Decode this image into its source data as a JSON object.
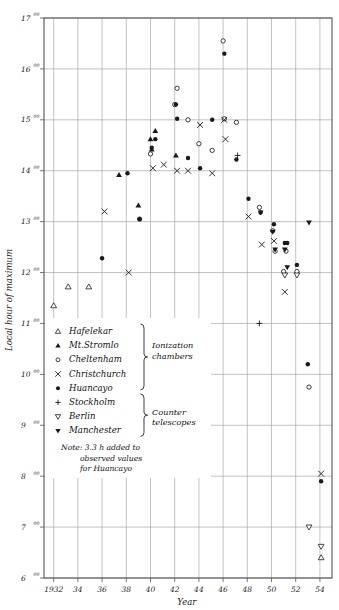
{
  "chart_data": {
    "type": "scatter",
    "title": "",
    "xlabel": "Year",
    "ylabel": "Local hour of maximum",
    "xlim": [
      1931.2,
      1955.0
    ],
    "ylim": [
      6,
      17
    ],
    "grid": true,
    "y_tick_labels": [
      "17",
      "16",
      "15",
      "14",
      "13",
      "12",
      "11",
      "10",
      "9",
      "8",
      "7",
      "6"
    ],
    "y_tick_values": [
      17,
      16,
      15,
      14,
      13,
      12,
      11,
      10,
      9,
      8,
      7,
      6
    ],
    "y_tick_superscript": "00",
    "x_tick_labels": [
      "1932",
      "34",
      "36",
      "38",
      "40",
      "42",
      "44",
      "46",
      "48",
      "50",
      "52",
      "54"
    ],
    "x_tick_values": [
      1932,
      1934,
      1936,
      1938,
      1940,
      1942,
      1944,
      1946,
      1948,
      1950,
      1952,
      1954
    ],
    "legend_position": "inside-lower-left",
    "note": [
      "Note: 3.3 h added to",
      "observed values",
      "for Huancayo"
    ],
    "groups": [
      {
        "label": "Ionization chambers",
        "members": [
          "Hafelekar",
          "Mt.Stromlo",
          "Cheltenham",
          "Christchurch",
          "Huancayo"
        ]
      },
      {
        "label": "Counter telescopes",
        "members": [
          "Stockholm",
          "Berlin",
          "Manchester"
        ]
      }
    ],
    "series": [
      {
        "name": "Hafelekar",
        "marker": "open-triangle-up",
        "points": [
          [
            1932.0,
            11.35
          ],
          [
            1933.2,
            11.72
          ],
          [
            1934.9,
            11.72
          ],
          [
            1954.1,
            6.4
          ]
        ]
      },
      {
        "name": "Mt.Stromlo",
        "marker": "filled-triangle-up",
        "points": [
          [
            1937.4,
            13.92
          ],
          [
            1939.0,
            13.32
          ],
          [
            1940.0,
            14.62
          ],
          [
            1940.1,
            14.42
          ],
          [
            1940.4,
            14.78
          ],
          [
            1942.1,
            14.3
          ]
        ]
      },
      {
        "name": "Cheltenham",
        "marker": "open-circle",
        "points": [
          [
            1939.1,
            13.05
          ],
          [
            1940.0,
            14.33
          ],
          [
            1942.0,
            15.3
          ],
          [
            1942.2,
            15.62
          ],
          [
            1943.1,
            15.0
          ],
          [
            1944.0,
            14.53
          ],
          [
            1945.1,
            14.4
          ],
          [
            1946.0,
            16.55
          ],
          [
            1946.1,
            15.02
          ],
          [
            1947.1,
            14.95
          ],
          [
            1949.0,
            13.28
          ],
          [
            1950.1,
            12.82
          ],
          [
            1950.3,
            12.42
          ],
          [
            1951.2,
            12.42
          ],
          [
            1951.0,
            12.02
          ],
          [
            1952.1,
            12.02
          ],
          [
            1953.1,
            9.75
          ]
        ]
      },
      {
        "name": "Christchurch",
        "marker": "x",
        "points": [
          [
            1936.2,
            13.2
          ],
          [
            1938.2,
            12.0
          ],
          [
            1940.2,
            14.05
          ],
          [
            1941.1,
            14.12
          ],
          [
            1942.2,
            14.0
          ],
          [
            1943.1,
            14.0
          ],
          [
            1944.1,
            14.9
          ],
          [
            1945.1,
            13.95
          ],
          [
            1946.1,
            15.0
          ],
          [
            1946.2,
            14.62
          ],
          [
            1948.1,
            13.1
          ],
          [
            1949.2,
            12.55
          ],
          [
            1950.2,
            12.62
          ],
          [
            1951.1,
            11.62
          ],
          [
            1954.1,
            8.05
          ]
        ]
      },
      {
        "name": "Huancayo",
        "marker": "filled-circle",
        "points": [
          [
            1936.0,
            12.28
          ],
          [
            1938.1,
            13.95
          ],
          [
            1939.1,
            13.05
          ],
          [
            1940.1,
            14.45
          ],
          [
            1940.4,
            14.62
          ],
          [
            1942.1,
            15.3
          ],
          [
            1942.2,
            15.02
          ],
          [
            1943.1,
            14.25
          ],
          [
            1944.1,
            14.05
          ],
          [
            1945.1,
            15.0
          ],
          [
            1946.1,
            16.3
          ],
          [
            1947.1,
            14.22
          ],
          [
            1948.1,
            13.45
          ],
          [
            1949.1,
            13.18
          ],
          [
            1950.2,
            12.95
          ],
          [
            1951.1,
            12.58
          ],
          [
            1951.3,
            12.58
          ],
          [
            1952.1,
            12.15
          ],
          [
            1953.0,
            10.2
          ],
          [
            1954.1,
            7.9
          ]
        ]
      },
      {
        "name": "Stockholm",
        "marker": "plus",
        "points": [
          [
            1947.2,
            14.3
          ],
          [
            1949.0,
            11.0
          ]
        ]
      },
      {
        "name": "Berlin",
        "marker": "open-triangle-down",
        "points": [
          [
            1951.1,
            11.95
          ],
          [
            1952.1,
            11.95
          ],
          [
            1953.1,
            7.0
          ],
          [
            1954.1,
            6.62
          ]
        ]
      },
      {
        "name": "Manchester",
        "marker": "filled-triangle-down",
        "points": [
          [
            1949.1,
            13.18
          ],
          [
            1950.1,
            12.8
          ],
          [
            1950.3,
            12.45
          ],
          [
            1951.1,
            12.45
          ],
          [
            1951.3,
            12.1
          ],
          [
            1953.1,
            12.98
          ]
        ]
      }
    ]
  },
  "legend": {
    "entries": [
      {
        "marker": "open-triangle-up",
        "label": "Hafelekar"
      },
      {
        "marker": "filled-triangle-up",
        "label": "Mt.Stromlo"
      },
      {
        "marker": "open-circle",
        "label": "Cheltenham"
      },
      {
        "marker": "x",
        "label": "Christchurch"
      },
      {
        "marker": "filled-circle",
        "label": "Huancayo"
      },
      {
        "marker": "plus",
        "label": "Stockholm"
      },
      {
        "marker": "open-triangle-down",
        "label": "Berlin"
      },
      {
        "marker": "filled-triangle-down",
        "label": "Manchester"
      }
    ],
    "group_labels": [
      "Ionization",
      "chambers",
      "Counter",
      "telescopes"
    ],
    "note_lines": [
      "Note: 3.3 h added to",
      "observed values",
      "for Huancayo"
    ]
  },
  "colors": {
    "ink": "#1a1a1a",
    "grid": "#9a9a9a",
    "axis": "#555555"
  }
}
